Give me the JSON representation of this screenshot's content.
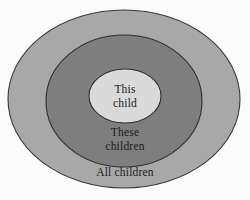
{
  "diagram": {
    "type": "nested-ellipses",
    "background_color": "#fdfdfd",
    "rings": [
      {
        "id": "outer",
        "name": "all-children",
        "label_lines": [
          "All children"
        ],
        "fill_color": "#a9a9a9",
        "stroke_color": "#3a3a3a",
        "cx": 124,
        "cy": 99,
        "rx": 116,
        "ry": 89
      },
      {
        "id": "middle",
        "name": "these-children",
        "label_lines": [
          "These",
          "children"
        ],
        "fill_color": "#7f7f7f",
        "stroke_color": "#2e2e2e",
        "cx": 124,
        "cy": 101,
        "rx": 78,
        "ry": 66
      },
      {
        "id": "inner",
        "name": "this-child",
        "label_lines": [
          "This",
          "child"
        ],
        "fill_color": "#dcdcdc",
        "stroke_color": "#2e2e2e",
        "cx": 125,
        "cy": 96,
        "rx": 36,
        "ry": 27
      }
    ]
  },
  "labels": {
    "inner_line1": "This",
    "inner_line2": "child",
    "middle_line1": "These",
    "middle_line2": "children",
    "outer_line1": "All children"
  }
}
